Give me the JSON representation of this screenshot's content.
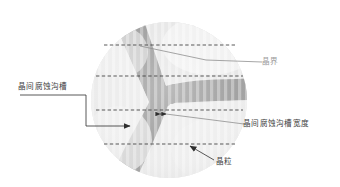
{
  "figure": {
    "title": "",
    "type": "microstructure-schematic"
  },
  "colors": {
    "background": "#ffffff",
    "grain_light": "#e8e8e8",
    "grain_lighter": "#efefef",
    "grain_mid": "#e0e0e0",
    "grain_boundary": "#9d9d9d",
    "grain_boundary_dark": "#939393",
    "dashed_line": "#3c3c3c",
    "leader_line": "#7d7d7d",
    "label_text": "#404040",
    "label_text_faint": "#9a9a9a"
  },
  "labels": {
    "groove": "晶间腐蚀沟槽",
    "boundary": "晶界",
    "groove_width": "晶间腐蚀沟槽宽度",
    "grain": "晶粒"
  },
  "icons": {
    "arrow_groove": "arrow-right-icon",
    "arrow_grain": "arrow-upleft-icon",
    "marker_width": "double-arrow-icon"
  },
  "geometry": {
    "circle_center_x": 169,
    "circle_center_y": 100,
    "circle_radius": 78,
    "dashed_line_y": [
      45,
      76,
      110,
      144
    ],
    "dashed_line_x_start": 96,
    "dashed_line_x_end": 243
  }
}
